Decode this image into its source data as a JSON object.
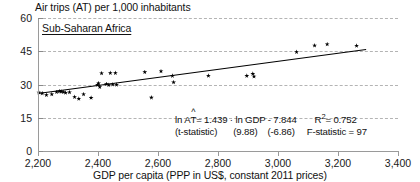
{
  "chart_data": {
    "type": "scatter",
    "title": "Air trips (AT) per 1,000 inhabitants",
    "subtitle": "Sub-Saharan Africa",
    "xlabel": "GDP per capita (PPP in US$, constant 2011 prices)",
    "ylabel": "",
    "xlim": [
      2200,
      3400
    ],
    "ylim": [
      0,
      60
    ],
    "xticks": [
      "2,200",
      "2,400",
      "2,600",
      "2,800",
      "3,000",
      "3,200",
      "3,400"
    ],
    "xtick_values": [
      2200,
      2400,
      2600,
      2800,
      3000,
      3200,
      3400
    ],
    "yticks": [
      "0",
      "15",
      "30",
      "45",
      "60"
    ],
    "ytick_values": [
      0,
      15,
      30,
      45,
      60
    ],
    "grid": "horizontal-dashed",
    "legend": "none",
    "series": [
      {
        "name": "Air trips per 1,000 inhabitants",
        "marker": "star",
        "color": "#000000",
        "points": [
          [
            2203,
            26.4
          ],
          [
            2214,
            26.0
          ],
          [
            2228,
            25.3
          ],
          [
            2246,
            25.6
          ],
          [
            2262,
            26.6
          ],
          [
            2271,
            26.9
          ],
          [
            2277,
            26.8
          ],
          [
            2284,
            26.6
          ],
          [
            2292,
            26.3
          ],
          [
            2305,
            26.5
          ],
          [
            2322,
            24.4
          ],
          [
            2336,
            23.6
          ],
          [
            2352,
            25.6
          ],
          [
            2377,
            24.0
          ],
          [
            2398,
            29.9
          ],
          [
            2402,
            30.6
          ],
          [
            2406,
            28.9
          ],
          [
            2412,
            35.1
          ],
          [
            2428,
            30.2
          ],
          [
            2436,
            29.8
          ],
          [
            2441,
            35.2
          ],
          [
            2449,
            30.0
          ],
          [
            2458,
            35.2
          ],
          [
            2462,
            29.9
          ],
          [
            2556,
            35.6
          ],
          [
            2578,
            24.1
          ],
          [
            2610,
            36.0
          ],
          [
            2648,
            33.9
          ],
          [
            2652,
            31.0
          ],
          [
            2768,
            34.0
          ],
          [
            2896,
            33.9
          ],
          [
            2916,
            34.8
          ],
          [
            2920,
            33.6
          ],
          [
            3062,
            44.7
          ],
          [
            3122,
            47.6
          ],
          [
            3164,
            48.2
          ],
          [
            3262,
            47.5
          ]
        ]
      }
    ],
    "trendline": {
      "x_start": 2200,
      "y_start": 26.2,
      "x_end": 3292,
      "y_end": 46.0,
      "color": "#000000"
    },
    "annotations": {
      "equation_prefix": "ln A",
      "equation_hat_var": "T",
      "equation_body": " = 1.439 · ln GDP - 7.844",
      "r_squared_label": "R",
      "r_squared_sup": "2",
      "r_squared_value": " = 0.752",
      "tstat_label": "(t-statistic)",
      "tstat_slope": "(9.88)",
      "tstat_intercept": "(-6.86)",
      "fstat": "F-statistic = 97"
    }
  }
}
